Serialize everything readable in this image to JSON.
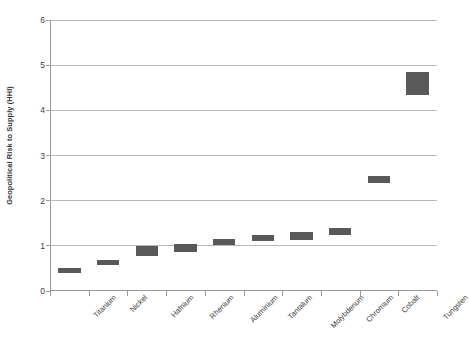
{
  "chart_data": {
    "type": "bar",
    "bar_style": "floating-range",
    "title": "",
    "xlabel": "",
    "ylabel": "Geopolitical Risk to Supply (HHI)",
    "ylim": [
      0,
      6
    ],
    "yticks": [
      0,
      1,
      2,
      3,
      4,
      5,
      6
    ],
    "ytick_labels": [
      "0",
      "1",
      "2",
      "3",
      "4",
      "5",
      "6"
    ],
    "grid": true,
    "legend": "none",
    "bar_color": "#595959",
    "categories": [
      "Titanium",
      "Nickel",
      "Hafnium",
      "Rhenium",
      "Aluminium",
      "Tantalum",
      "Molybdenum",
      "Chromium",
      "Cobalt",
      "Tungsten"
    ],
    "low": [
      0.4,
      0.58,
      0.78,
      0.87,
      1.02,
      1.1,
      1.13,
      1.25,
      2.4,
      4.35
    ],
    "high": [
      0.5,
      0.68,
      1.0,
      1.05,
      1.15,
      1.25,
      1.3,
      1.4,
      2.55,
      4.85
    ],
    "values": [
      0.45,
      0.63,
      0.89,
      0.96,
      1.08,
      1.17,
      1.21,
      1.32,
      2.47,
      4.6
    ]
  }
}
